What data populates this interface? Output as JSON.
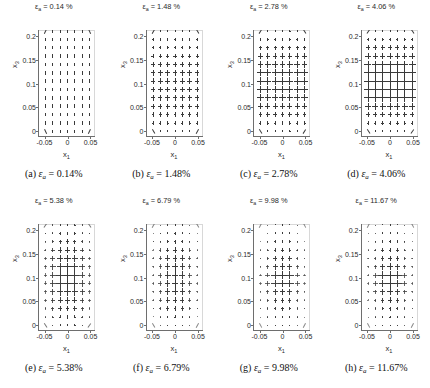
{
  "figure": {
    "axis_labels": {
      "x": "x",
      "x_sub": "1",
      "y": "x",
      "y_sub": "3"
    },
    "xticks": [
      "-0.05",
      "0",
      "0.05"
    ],
    "xtick_values": [
      -0.05,
      0,
      0.05
    ],
    "yticks": [
      "0",
      "0.05",
      "0.1",
      "0.15",
      "0.2"
    ],
    "ytick_values": [
      0,
      0.05,
      0.1,
      0.15,
      0.2
    ],
    "xlim": [
      -0.062,
      0.062
    ],
    "ylim": [
      -0.012,
      0.212
    ],
    "symbol": "ε",
    "symbol_sub": "a",
    "percent": "%"
  },
  "panels": [
    {
      "letter": "a",
      "strain": "0.14",
      "title": "ε",
      "title_sub": "a",
      "title_value": "= 0.14 %",
      "caption_value": "= 0.14%"
    },
    {
      "letter": "b",
      "strain": "1.48",
      "title": "ε",
      "title_sub": "a",
      "title_value": "= 1.48 %",
      "caption_value": "= 1.48%"
    },
    {
      "letter": "c",
      "strain": "2.78",
      "title": "ε",
      "title_sub": "a",
      "title_value": "= 2.78 %",
      "caption_value": "= 2.78%"
    },
    {
      "letter": "d",
      "strain": "4.06",
      "title": "ε",
      "title_sub": "a",
      "title_value": "= 4.06 %",
      "caption_value": "= 4.06%"
    },
    {
      "letter": "e",
      "strain": "5.38",
      "title": "ε",
      "title_sub": "a",
      "title_value": "= 5.38 %",
      "caption_value": "= 5.38%"
    },
    {
      "letter": "f",
      "strain": "6.79",
      "title": "ε",
      "title_sub": "a",
      "title_value": "= 6.79 %",
      "caption_value": "= 6.79%"
    },
    {
      "letter": "g",
      "strain": "9.98",
      "title": "ε",
      "title_sub": "a",
      "title_value": "= 9.98 %",
      "caption_value": "= 9.98%"
    },
    {
      "letter": "h",
      "strain": "11.67",
      "title": "ε",
      "title_sub": "a",
      "title_value": "= 11.67 %",
      "caption_value": "= 11.67%"
    }
  ],
  "chart_data": {
    "type": "scatter",
    "subplot_layout": [
      2,
      4
    ],
    "xlabel": "x1",
    "ylabel": "x3",
    "xlim": [
      -0.062,
      0.062
    ],
    "ylim": [
      -0.012,
      0.212
    ],
    "xticks": [
      -0.05,
      0,
      0.05
    ],
    "yticks": [
      0,
      0.05,
      0.1,
      0.15,
      0.2
    ],
    "grid": false,
    "legend": "none",
    "marker_style": "crossed-line-segments (principal direction pair)",
    "grid_nx": 7,
    "grid_ny": 13,
    "grid_x": [
      -0.048,
      -0.032,
      -0.016,
      0.0,
      0.016,
      0.032,
      0.048
    ],
    "grid_y": [
      0.0,
      0.0175,
      0.035,
      0.0525,
      0.07,
      0.0875,
      0.105,
      0.1225,
      0.14,
      0.1575,
      0.175,
      0.1925,
      0.21
    ],
    "series": [
      {
        "name": "a",
        "strain_pct": 0.14,
        "description": "near-vertical short segments, nearly uniform across the grid; slight outward tilt at top and bottom corners",
        "v_scale": [
          0.3,
          0.32,
          0.33,
          0.34,
          0.34,
          0.34,
          0.34,
          0.34,
          0.33,
          0.32,
          0.31,
          0.3,
          0.28
        ],
        "h_scale": [
          0.02,
          0.02,
          0.02,
          0.02,
          0.02,
          0.02,
          0.02,
          0.02,
          0.02,
          0.02,
          0.02,
          0.02,
          0.02
        ],
        "corner_tilt_deg": 25
      },
      {
        "name": "b",
        "strain_pct": 1.48,
        "description": "plus/cross markers appear; horizontal component grows, maximum around x3 = 0.09-0.13",
        "v_scale": [
          0.18,
          0.3,
          0.4,
          0.46,
          0.5,
          0.52,
          0.52,
          0.5,
          0.46,
          0.4,
          0.32,
          0.22,
          0.14
        ],
        "h_scale": [
          0.06,
          0.16,
          0.26,
          0.34,
          0.4,
          0.44,
          0.44,
          0.42,
          0.36,
          0.28,
          0.2,
          0.12,
          0.06
        ],
        "corner_tilt_deg": 30
      },
      {
        "name": "c",
        "strain_pct": 2.78,
        "description": "larger crosses, band of maximum intensity centred at x3 ~ 0.10",
        "v_scale": [
          0.16,
          0.3,
          0.44,
          0.54,
          0.62,
          0.68,
          0.7,
          0.66,
          0.58,
          0.48,
          0.36,
          0.24,
          0.14
        ],
        "h_scale": [
          0.06,
          0.18,
          0.32,
          0.44,
          0.56,
          0.64,
          0.66,
          0.62,
          0.52,
          0.4,
          0.26,
          0.14,
          0.06
        ],
        "corner_tilt_deg": 32
      },
      {
        "name": "d",
        "strain_pct": 4.06,
        "description": "largest, densest crosses; broad high-intensity band from x3 ~ 0.05 to 0.15",
        "v_scale": [
          0.18,
          0.34,
          0.52,
          0.64,
          0.74,
          0.82,
          0.84,
          0.8,
          0.7,
          0.58,
          0.44,
          0.28,
          0.16
        ],
        "h_scale": [
          0.08,
          0.22,
          0.4,
          0.56,
          0.68,
          0.78,
          0.8,
          0.76,
          0.64,
          0.5,
          0.34,
          0.18,
          0.08
        ],
        "corner_tilt_deg": 34
      },
      {
        "name": "e",
        "strain_pct": 5.38,
        "description": "crosses begin to concentrate toward the central columns; edges fade",
        "v_scale": [
          0.16,
          0.3,
          0.48,
          0.62,
          0.72,
          0.8,
          0.82,
          0.76,
          0.66,
          0.54,
          0.4,
          0.26,
          0.14
        ],
        "h_scale": [
          0.06,
          0.18,
          0.34,
          0.48,
          0.6,
          0.7,
          0.72,
          0.66,
          0.56,
          0.42,
          0.28,
          0.16,
          0.06
        ],
        "col_weight": [
          0.45,
          0.75,
          0.95,
          1.0,
          0.95,
          0.75,
          0.45
        ],
        "corner_tilt_deg": 34
      },
      {
        "name": "f",
        "strain_pct": 6.79,
        "description": "field localises into a narrow vertical band near x1 = 0; outer columns faint",
        "v_scale": [
          0.14,
          0.26,
          0.42,
          0.56,
          0.66,
          0.74,
          0.76,
          0.7,
          0.6,
          0.48,
          0.34,
          0.22,
          0.12
        ],
        "h_scale": [
          0.05,
          0.14,
          0.26,
          0.38,
          0.48,
          0.56,
          0.58,
          0.52,
          0.44,
          0.32,
          0.2,
          0.11,
          0.05
        ],
        "col_weight": [
          0.3,
          0.6,
          0.92,
          1.0,
          0.92,
          0.6,
          0.3
        ],
        "corner_tilt_deg": 30
      },
      {
        "name": "g",
        "strain_pct": 9.98,
        "description": "strong localisation: one dominant horizontal streak at x3 ~ 0.085-0.10 across central columns",
        "v_scale": [
          0.12,
          0.22,
          0.36,
          0.48,
          0.6,
          0.72,
          0.74,
          0.62,
          0.5,
          0.4,
          0.28,
          0.18,
          0.1
        ],
        "h_scale": [
          0.04,
          0.1,
          0.2,
          0.32,
          0.52,
          0.78,
          0.8,
          0.5,
          0.34,
          0.24,
          0.15,
          0.08,
          0.04
        ],
        "col_weight": [
          0.28,
          0.58,
          0.9,
          1.0,
          0.9,
          0.58,
          0.28
        ],
        "corner_tilt_deg": 28
      },
      {
        "name": "h",
        "strain_pct": 11.67,
        "description": "fully localised band; dominant horizontal segment at x3 ~ 0.09 with vertical segments either side",
        "v_scale": [
          0.12,
          0.22,
          0.36,
          0.5,
          0.62,
          0.74,
          0.76,
          0.64,
          0.52,
          0.42,
          0.3,
          0.19,
          0.1
        ],
        "h_scale": [
          0.04,
          0.1,
          0.2,
          0.34,
          0.56,
          0.82,
          0.84,
          0.52,
          0.36,
          0.25,
          0.16,
          0.09,
          0.04
        ],
        "col_weight": [
          0.3,
          0.6,
          0.92,
          1.0,
          0.92,
          0.6,
          0.3
        ],
        "corner_tilt_deg": 28
      }
    ]
  }
}
